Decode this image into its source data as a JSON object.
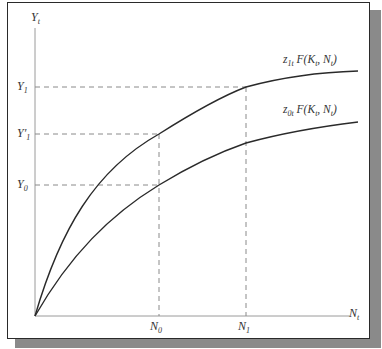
{
  "axes": {
    "y_label": "Y",
    "y_label_sub": "t",
    "x_label": "N",
    "x_label_sub": "t"
  },
  "y_ticks": [
    {
      "main": "Y",
      "sub": "1",
      "prime": ""
    },
    {
      "main": "Y",
      "sub": "1",
      "prime": "′"
    },
    {
      "main": "Y",
      "sub": "0",
      "prime": ""
    }
  ],
  "x_ticks": [
    {
      "main": "N",
      "sub": "0"
    },
    {
      "main": "N",
      "sub": "1"
    }
  ],
  "curves": [
    {
      "name": "upper",
      "z": "z",
      "z_sub": "1t",
      "func": "F(K",
      "k_sub": "t",
      "mid": ", N",
      "n_sub": "t",
      "close": ")"
    },
    {
      "name": "lower",
      "z": "z",
      "z_sub": "0t",
      "func": "F(K",
      "k_sub": "t",
      "mid": ", N",
      "n_sub": "t",
      "close": ")"
    }
  ],
  "colors": {
    "curve": "#2a2a2a",
    "axis": "#9a9a9a",
    "dash": "#8a8a8a",
    "frame": "#2a2a2a",
    "shadow": "#8a8a8a"
  }
}
